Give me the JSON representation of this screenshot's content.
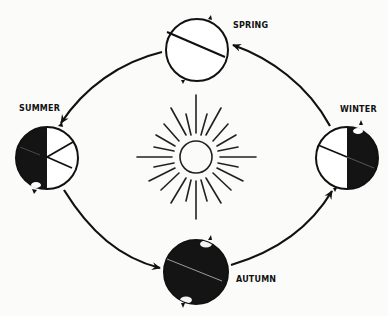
{
  "diagram": {
    "type": "seasonal-orbit",
    "center_object": {
      "name": "sun",
      "icon": "sun-icon"
    },
    "seasons": [
      {
        "key": "spring",
        "label": "SPRING",
        "position": "top",
        "shading": "none"
      },
      {
        "key": "summer",
        "label": "SUMMER",
        "position": "left",
        "shading": "left-half-dark"
      },
      {
        "key": "autumn",
        "label": "AUTUMN",
        "position": "bottom",
        "shading": "fully-dark"
      },
      {
        "key": "winter",
        "label": "WINTER",
        "position": "right",
        "shading": "right-half-dark"
      }
    ],
    "arrows": [
      {
        "from": "spring",
        "to": "summer"
      },
      {
        "from": "summer",
        "to": "autumn"
      },
      {
        "from": "autumn",
        "to": "winter"
      },
      {
        "from": "winter",
        "to": "spring"
      }
    ],
    "colors": {
      "ink": "#111111",
      "paper": "#fbfbf9",
      "dark_fill": "#141414"
    }
  }
}
